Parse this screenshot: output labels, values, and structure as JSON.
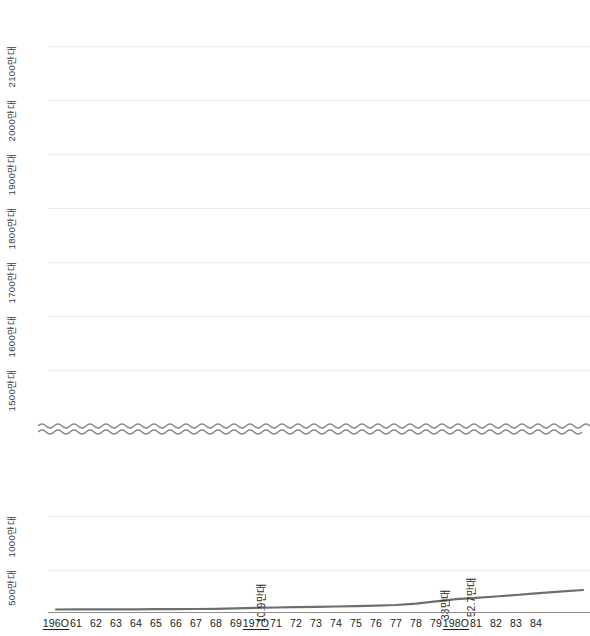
{
  "chart_data": {
    "type": "line",
    "title": "",
    "xlabel": "",
    "ylabel": "",
    "unit_note": "만대",
    "axis_break": true,
    "grid": true,
    "legend": "none",
    "x": [
      "1960",
      "61",
      "62",
      "63",
      "64",
      "65",
      "66",
      "67",
      "68",
      "69",
      "1970",
      "71",
      "72",
      "73",
      "74",
      "75",
      "76",
      "77",
      "78",
      "79",
      "1980",
      "81",
      "82",
      "83",
      "84"
    ],
    "x_emphasis": [
      "1960",
      "1970",
      "1980"
    ],
    "values": [
      0.3,
      0.4,
      0.5,
      0.6,
      0.7,
      0.8,
      1.0,
      1.5,
      2.5,
      6.0,
      10.9,
      13.0,
      14.5,
      16.0,
      18.0,
      20.0,
      22.5,
      26.0,
      33.0,
      42.0,
      52.7,
      57.0,
      62.0,
      68.0,
      75.0
    ],
    "ylim_lower": [
      0,
      1300
    ],
    "ylim_upper": [
      1450,
      2150
    ],
    "y_ticks_lower": [
      "500만대",
      "1000만대"
    ],
    "y_ticks_lower_values": [
      500,
      1000
    ],
    "y_ticks_upper": [
      "1500만대",
      "1600만대",
      "1700만대",
      "1800만대",
      "1900만대",
      "2000만대",
      "2100만대"
    ],
    "y_ticks_upper_values": [
      1500,
      1600,
      1700,
      1800,
      1900,
      2000,
      2100
    ],
    "annotations": [
      {
        "x": "1970",
        "label": "10.9만대",
        "value": 10.9
      },
      {
        "x": "78",
        "label": "33만대",
        "value": 33
      },
      {
        "x": "1980",
        "label": "52.7만대",
        "value": 52.7
      }
    ],
    "colors": {
      "line": "#6e6e6e",
      "grid": "#ececec",
      "axis": "#8d8d8d",
      "text": "#222222",
      "break": "#8a8a8a"
    }
  }
}
